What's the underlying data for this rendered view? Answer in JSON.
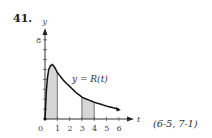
{
  "problem": {
    "number": "41.",
    "reference": "(6-5, 7-1)"
  },
  "chart_data": {
    "type": "area",
    "title": "",
    "xlabel": "t",
    "ylabel": "y",
    "curve_label": "y = R(t)",
    "xlim": [
      0,
      6.5
    ],
    "ylim": [
      0,
      8.5
    ],
    "x_ticks": [
      0,
      1,
      2,
      3,
      4,
      5,
      6
    ],
    "x_tick_labels": [
      "0",
      "1",
      "2",
      "3",
      "4",
      "5",
      "6"
    ],
    "y_ticks": [
      1,
      2,
      3,
      4,
      5,
      6,
      7,
      8
    ],
    "y_tick_labels_shown": [
      "8"
    ],
    "grid": false,
    "series": [
      {
        "name": "R(t)",
        "x": [
          0,
          0.1,
          0.2,
          0.3,
          0.45,
          0.6,
          0.8,
          1.0,
          1.5,
          2.0,
          2.5,
          3.0,
          3.5,
          4.0,
          4.5,
          5.0,
          5.5,
          6.0
        ],
        "values": [
          0,
          2.6,
          4.2,
          5.0,
          5.4,
          5.5,
          5.2,
          4.7,
          3.9,
          3.3,
          2.7,
          2.2,
          1.95,
          1.7,
          1.5,
          1.3,
          1.15,
          1.0
        ]
      }
    ],
    "shaded_intervals": [
      [
        0,
        1
      ],
      [
        3,
        4
      ]
    ],
    "annotations": [
      {
        "text": "y = R(t)",
        "x": 2.3,
        "y": 4.0
      }
    ]
  }
}
